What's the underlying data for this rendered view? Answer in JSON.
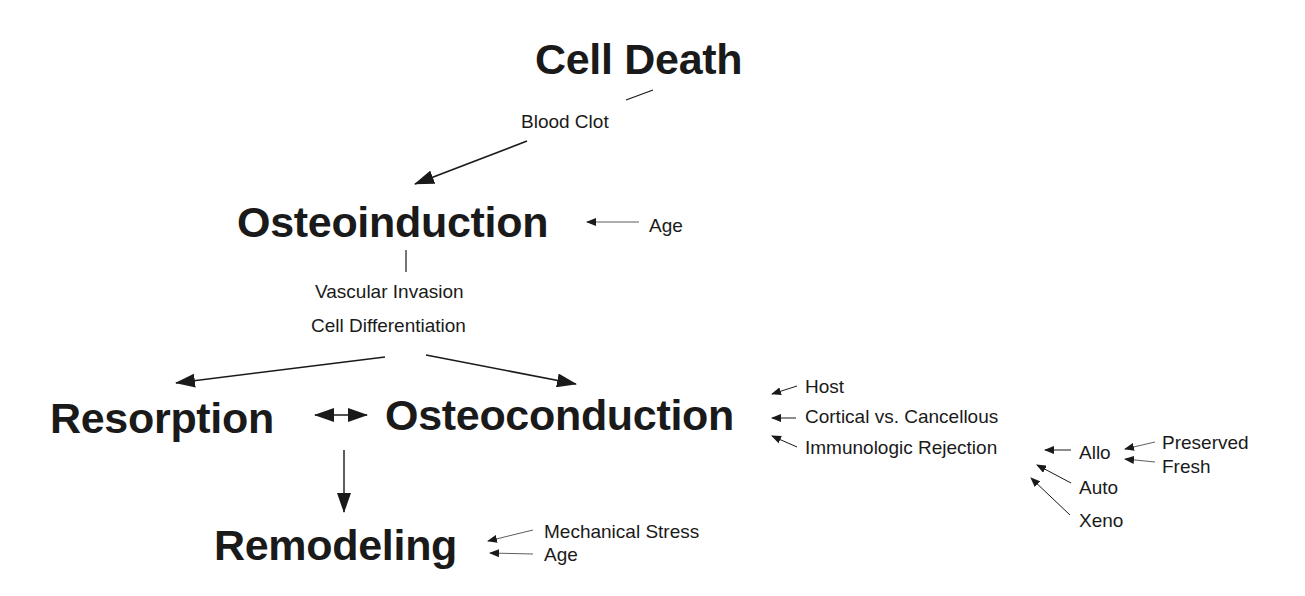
{
  "diagram": {
    "main_nodes": {
      "cell_death": "Cell Death",
      "osteoinduction": "Osteoinduction",
      "resorption": "Resorption",
      "osteoconduction": "Osteoconduction",
      "remodeling": "Remodeling"
    },
    "labels": {
      "blood_clot": "Blood Clot",
      "age_induction": "Age",
      "vascular_invasion": "Vascular Invasion",
      "cell_differentiation": "Cell Differentiation",
      "host": "Host",
      "cortical_vs_cancellous": "Cortical vs. Cancellous",
      "immunologic_rejection": "Immunologic Rejection",
      "allo": "Allo",
      "auto": "Auto",
      "xeno": "Xeno",
      "preserved": "Preserved",
      "fresh": "Fresh",
      "mechanical_stress": "Mechanical Stress",
      "age_remodeling": "Age"
    },
    "edges": [
      {
        "from": "Cell Death",
        "to": "Osteoinduction",
        "via": "Blood Clot"
      },
      {
        "from": "Age",
        "to": "Osteoinduction"
      },
      {
        "from": "Osteoinduction",
        "to": "Resorption",
        "via": "Vascular Invasion / Cell Differentiation"
      },
      {
        "from": "Osteoinduction",
        "to": "Osteoconduction",
        "via": "Vascular Invasion / Cell Differentiation"
      },
      {
        "from": "Resorption",
        "to": "Osteoconduction",
        "bidirectional": true
      },
      {
        "from": "Resorption",
        "to": "Remodeling"
      },
      {
        "from": "Host",
        "to": "Osteoconduction"
      },
      {
        "from": "Cortical vs. Cancellous",
        "to": "Osteoconduction"
      },
      {
        "from": "Immunologic Rejection",
        "to": "Osteoconduction"
      },
      {
        "from": "Allo",
        "to": "Immunologic Rejection"
      },
      {
        "from": "Auto",
        "to": "Immunologic Rejection"
      },
      {
        "from": "Xeno",
        "to": "Immunologic Rejection"
      },
      {
        "from": "Preserved",
        "to": "Allo"
      },
      {
        "from": "Fresh",
        "to": "Allo"
      },
      {
        "from": "Mechanical Stress",
        "to": "Remodeling"
      },
      {
        "from": "Age",
        "to": "Remodeling"
      }
    ],
    "colors": {
      "ink": "#1a1a1a",
      "background": "#ffffff"
    }
  }
}
